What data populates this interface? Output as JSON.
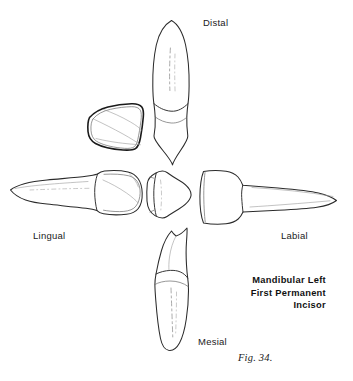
{
  "figure": {
    "subject": "Mandibular Left First Permanent Incisor",
    "fig_number": "Fig. 34.",
    "background_color": "#ffffff",
    "ink_color": "#2b2b2b",
    "orientation_labels": {
      "distal": "Distal",
      "lingual": "Lingual",
      "labial": "Labial",
      "mesial": "Mesial"
    },
    "caption": {
      "line1": "Mandibular Left",
      "line2": "First Permanent",
      "line3": "Incisor"
    },
    "views": [
      {
        "name": "distal-view",
        "position": "top",
        "description": "Distal aspect of tooth, root superior, crown inferior"
      },
      {
        "name": "lingual-view",
        "position": "left",
        "description": "Lingual aspect, root pointing left, crown right"
      },
      {
        "name": "labial-view",
        "position": "right",
        "description": "Labial aspect, crown left, root pointing right"
      },
      {
        "name": "mesial-view",
        "position": "bottom",
        "description": "Mesial aspect, crown superior, root inferior"
      },
      {
        "name": "incisal-view",
        "position": "center",
        "description": "Incisal aspect, occlusal outline of crown"
      },
      {
        "name": "crown-detail-view",
        "position": "upper-left",
        "description": "Crown only, wedge outline with heavy lingual border"
      }
    ]
  }
}
